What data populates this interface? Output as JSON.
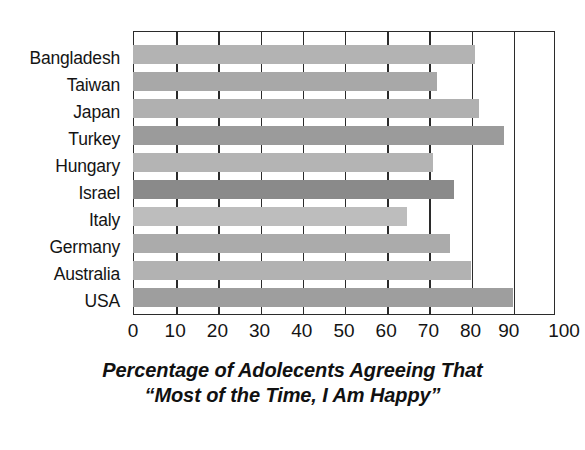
{
  "chart_data": {
    "type": "bar",
    "orientation": "horizontal",
    "title": "",
    "caption_line1": "Percentage of Adolecents Agreeing That",
    "caption_line2": "“Most of the Time, I Am Happy”",
    "xlabel": "",
    "ylabel": "",
    "xlim": [
      0,
      100
    ],
    "xticks": [
      0,
      10,
      20,
      30,
      40,
      50,
      60,
      70,
      80,
      90,
      100
    ],
    "xtick_labels": [
      "0",
      "10",
      "20",
      "30",
      "40",
      "50",
      "60",
      "70",
      "80",
      "90",
      "100"
    ],
    "grid": "vertical",
    "legend": "none",
    "categories": [
      "Bangladesh",
      "Taiwan",
      "Japan",
      "Turkey",
      "Hungary",
      "Israel",
      "Italy",
      "Germany",
      "Australia",
      "USA"
    ],
    "values": [
      81,
      72,
      82,
      88,
      71,
      76,
      65,
      75,
      80,
      90
    ],
    "bar_colors": [
      "#b3b3b3",
      "#a8a8a8",
      "#b0b0b0",
      "#9b9b9b",
      "#b4b4b4",
      "#8a8a8a",
      "#bdbdbd",
      "#ababab",
      "#b2b2b2",
      "#9e9e9e"
    ],
    "frame_color": "#2b2b2b",
    "background_color": "#ffffff",
    "text_color": "#141414"
  }
}
